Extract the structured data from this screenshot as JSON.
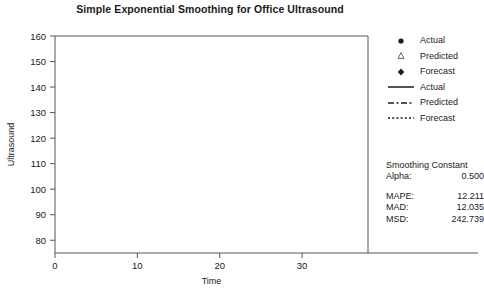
{
  "chart_data": {
    "type": "line",
    "title": "Simple Exponential Smoothing for Office Ultrasound",
    "xlabel": "Time",
    "ylabel": "Ultrasound",
    "xlim": [
      0,
      38
    ],
    "ylim": [
      75,
      160
    ],
    "xticks": [
      0,
      10,
      20,
      30
    ],
    "yticks": [
      80,
      90,
      100,
      110,
      120,
      130,
      140,
      150,
      160
    ],
    "grid": false,
    "legend_position": "right",
    "x": [
      1,
      2,
      3,
      4,
      5,
      6,
      7,
      8,
      9,
      10,
      11,
      12,
      13,
      14,
      15,
      16,
      17,
      18,
      19,
      20,
      21,
      22,
      23,
      24,
      25,
      26,
      27,
      28,
      29,
      30,
      31,
      32,
      33,
      34,
      35,
      36
    ],
    "series": [
      {
        "name": "Actual",
        "marker": "filled-circle",
        "line": "solid",
        "values": [
          95,
          107,
          107,
          105,
          94,
          111,
          77,
          89,
          82,
          80,
          83,
          79,
          82,
          81,
          80,
          80,
          91,
          94,
          101,
          117,
          133,
          120,
          122,
          90,
          105,
          77,
          91,
          116,
          89,
          90,
          107,
          95,
          77,
          113,
          109,
          140
        ]
      },
      {
        "name": "Predicted",
        "marker": "open-triangle",
        "line": "dashed",
        "values": [
          99,
          97,
          101,
          104,
          105,
          99,
          105,
          91,
          90,
          86,
          83,
          83,
          81,
          82,
          81,
          81,
          80,
          86,
          90,
          95,
          106,
          120,
          120,
          121,
          105,
          105,
          91,
          91,
          104,
          96,
          93,
          100,
          98,
          87,
          100,
          105
        ]
      },
      {
        "name": "Forecast",
        "marker": "filled-diamond",
        "line": "dotted",
        "x": [
          37
        ],
        "values": [
          124
        ]
      }
    ]
  },
  "legend": {
    "items": [
      {
        "key": "filled-circle-marker",
        "label": "Actual"
      },
      {
        "key": "open-triangle-marker",
        "label": "Predicted"
      },
      {
        "key": "filled-diamond-marker",
        "label": "Forecast"
      },
      {
        "key": "solid-line",
        "label": "Actual"
      },
      {
        "key": "dashed-line",
        "label": "Predicted"
      },
      {
        "key": "dotted-line",
        "label": "Forecast"
      }
    ]
  },
  "stats": {
    "smoothing_title": "Smoothing Constant",
    "alpha_label": "Alpha:",
    "alpha_value": "0.500",
    "mape_label": "MAPE:",
    "mape_value": "12.211",
    "mad_label": "MAD:",
    "mad_value": "12.035",
    "msd_label": "MSD:",
    "msd_value": "242.739"
  },
  "colors": {
    "ink": "#1a1a1a",
    "axis": "#555555",
    "background": "#ffffff"
  }
}
